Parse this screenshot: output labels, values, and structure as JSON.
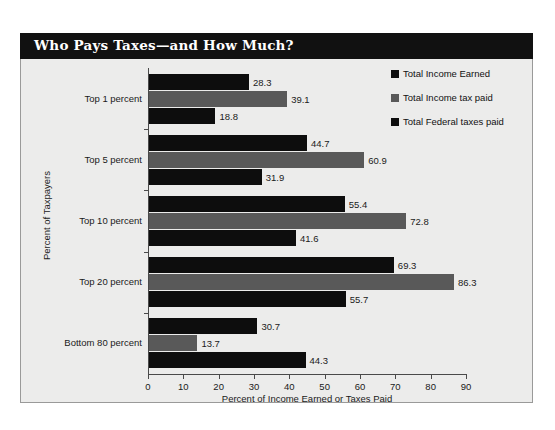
{
  "figure": {
    "title": "Who Pays Taxes—and How Much?",
    "background_color": "#ececeb",
    "banner_color": "#111111",
    "border_color": "#9a9a99"
  },
  "chart_data": {
    "type": "bar",
    "orientation": "horizontal",
    "title": "Who Pays Taxes—and How Much?",
    "xlabel": "Percent of Income Earned or Taxes Paid",
    "ylabel": "Percent of Taxpayers",
    "xlim": [
      0,
      90
    ],
    "xticks": [
      0,
      10,
      20,
      30,
      40,
      50,
      60,
      70,
      80,
      90
    ],
    "xtick_labels": [
      "0",
      "10",
      "20",
      "30",
      "40",
      "50",
      "60",
      "70",
      "80",
      "90"
    ],
    "grid": false,
    "legend_position": "upper right",
    "categories": [
      "Top 1 percent",
      "Top 5 percent",
      "Top 10 percent",
      "Top 20 percent",
      "Bottom 80 percent"
    ],
    "series": [
      {
        "name": "Total Income Earned",
        "color": "#0d0d0d",
        "values": [
          28.3,
          44.7,
          55.4,
          69.3,
          30.7
        ],
        "labels": [
          "28.3",
          "44.7",
          "55.4",
          "69.3",
          "30.7"
        ]
      },
      {
        "name": "Total Income tax paid",
        "color": "#595959",
        "values": [
          39.1,
          60.9,
          72.8,
          86.3,
          13.7
        ],
        "labels": [
          "39.1",
          "60.9",
          "72.8",
          "86.3",
          "13.7"
        ]
      },
      {
        "name": "Total Federal taxes paid",
        "color": "#0d0d0d",
        "values": [
          18.8,
          31.9,
          41.6,
          55.7,
          44.3
        ],
        "labels": [
          "18.8",
          "31.9",
          "41.6",
          "55.7",
          "44.3"
        ]
      }
    ]
  },
  "legend": {
    "entries": [
      {
        "label": "Total Income Earned",
        "color": "#0d0d0d"
      },
      {
        "label": "Total Income tax paid",
        "color": "#595959"
      },
      {
        "label": "Total Federal taxes paid",
        "color": "#0d0d0d"
      }
    ]
  }
}
